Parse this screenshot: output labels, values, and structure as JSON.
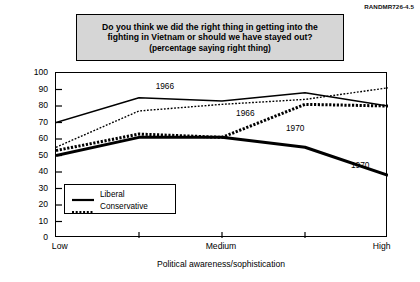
{
  "figure": {
    "corner_id": "RANDMR726-4.5"
  },
  "title": {
    "line1": "Do you think we did the right thing in getting into the",
    "line2": "fighting in Vietnam or should we have stayed out?",
    "line3": "(percentage saying right thing)"
  },
  "legend": {
    "items": [
      {
        "label": "Liberal",
        "style": "solid"
      },
      {
        "label": "Conservative",
        "style": "dotted"
      }
    ]
  },
  "annotations": [
    {
      "text": "1966",
      "series": "1966-liberal"
    },
    {
      "text": "1966",
      "series": "1966-conservative"
    },
    {
      "text": "1970",
      "series": "1970-conservative"
    },
    {
      "text": "1970",
      "series": "1970-liberal"
    }
  ],
  "chart_data": {
    "type": "line",
    "title": "Do you think we did the right thing in getting into the fighting in Vietnam or should we have stayed out? (percentage saying right thing)",
    "xlabel": "Political awareness/sophistication",
    "ylabel": "Percent",
    "categories": [
      "Low",
      "",
      "Medium",
      "",
      "High"
    ],
    "xtick_labels": [
      "Low",
      "Medium",
      "High"
    ],
    "ytick_labels": [
      "0",
      "10",
      "20",
      "30",
      "40",
      "50",
      "60",
      "70",
      "80",
      "90",
      "100"
    ],
    "ylim": [
      0,
      100
    ],
    "ytick_step": 10,
    "grid": false,
    "legend_position": "inside-lower-left",
    "series": [
      {
        "name": "1966 Liberal",
        "year": "1966",
        "ideology": "Liberal",
        "line_style": "solid",
        "line_weight": "thin",
        "color": "#000000",
        "values": [
          70,
          85,
          83,
          88,
          80
        ]
      },
      {
        "name": "1966 Conservative",
        "year": "1966",
        "ideology": "Conservative",
        "line_style": "dotted",
        "line_weight": "thin",
        "color": "#000000",
        "values": [
          55,
          77,
          81,
          84,
          91
        ]
      },
      {
        "name": "1970 Liberal",
        "year": "1970",
        "ideology": "Liberal",
        "line_style": "solid",
        "line_weight": "thick",
        "color": "#000000",
        "values": [
          50,
          61,
          61,
          55,
          38
        ]
      },
      {
        "name": "1970 Conservative",
        "year": "1970",
        "ideology": "Conservative",
        "line_style": "dotted",
        "line_weight": "thick",
        "color": "#000000",
        "values": [
          53,
          63,
          61,
          81,
          80
        ]
      }
    ]
  },
  "colors": {
    "title_box_fill": "#d6d6d6",
    "border": "#000000",
    "plot_background": "#ffffff"
  }
}
